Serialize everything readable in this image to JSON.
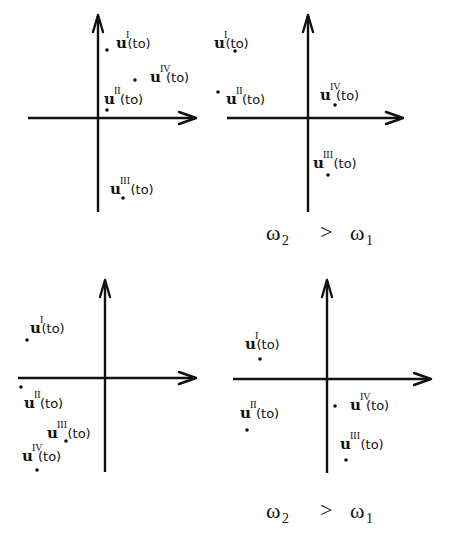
{
  "diagram": {
    "label_base": "u",
    "label_arg": "(to)",
    "panels": [
      {
        "id": "top-left",
        "origin": [
          98,
          118
        ],
        "axis": {
          "x_from": 28,
          "x_to": 196,
          "y_from": 212,
          "y_to": 15
        },
        "points": [
          {
            "sup": "I",
            "dot": [
              107,
              50
            ],
            "label": [
              116,
              48
            ]
          },
          {
            "sup": "IV",
            "dot": [
              135,
              80
            ],
            "label": [
              150,
              82
            ]
          },
          {
            "sup": "II",
            "dot": [
              107,
              110
            ],
            "label": [
              104,
              104
            ]
          },
          {
            "sup": "III",
            "dot": [
              123,
              198
            ],
            "label": [
              110,
              194
            ]
          }
        ]
      },
      {
        "id": "top-right",
        "origin": [
          308,
          118
        ],
        "axis": {
          "x_from": 227,
          "x_to": 403,
          "y_from": 212,
          "y_to": 15
        },
        "points": [
          {
            "sup": "I",
            "dot": [
              235,
              51
            ],
            "label": [
              214,
              48
            ]
          },
          {
            "sup": "II",
            "dot": [
              218,
              92
            ],
            "label": [
              226,
              104
            ]
          },
          {
            "sup": "IV",
            "dot": [
              335,
              105
            ],
            "label": [
              320,
              100
            ]
          },
          {
            "sup": "III",
            "dot": [
              328,
              175
            ],
            "label": [
              313,
              168
            ]
          }
        ]
      },
      {
        "id": "bottom-left",
        "origin": [
          105,
          378
        ],
        "axis": {
          "x_from": 18,
          "x_to": 196,
          "y_from": 472,
          "y_to": 280
        },
        "points": [
          {
            "sup": "I",
            "dot": [
              27,
              340
            ],
            "label": [
              30,
              333
            ]
          },
          {
            "sup": "II",
            "dot": [
              21,
              387
            ],
            "label": [
              24,
              408
            ]
          },
          {
            "sup": "III",
            "dot": [
              66,
              441
            ],
            "label": [
              47,
              438
            ]
          },
          {
            "sup": "IV",
            "dot": [
              37,
              470
            ],
            "label": [
              22,
              461
            ]
          }
        ]
      },
      {
        "id": "bottom-right",
        "origin": [
          327,
          379
        ],
        "axis": {
          "x_from": 233,
          "x_to": 431,
          "y_from": 473,
          "y_to": 280
        },
        "points": [
          {
            "sup": "I",
            "dot": [
              260,
              359
            ],
            "label": [
              245,
              349
            ]
          },
          {
            "sup": "II",
            "dot": [
              247,
              430
            ],
            "label": [
              240,
              418
            ]
          },
          {
            "sup": "IV",
            "dot": [
              335,
              406
            ],
            "label": [
              350,
              410
            ]
          },
          {
            "sup": "III",
            "dot": [
              346,
              460
            ],
            "label": [
              340,
              449
            ]
          }
        ]
      }
    ],
    "captions": [
      {
        "id": "caption-top",
        "pos": [
          266,
          240
        ],
        "lhs": "ω",
        "lhs_sub": "2",
        "op": ">",
        "rhs": "ω",
        "rhs_sub": "1",
        "op_x": 320,
        "rhs_x": 350
      },
      {
        "id": "caption-bottom",
        "pos": [
          266,
          518
        ],
        "lhs": "ω",
        "lhs_sub": "2",
        "op": ">",
        "rhs": "ω",
        "rhs_sub": "1",
        "op_x": 320,
        "rhs_x": 350
      }
    ]
  }
}
